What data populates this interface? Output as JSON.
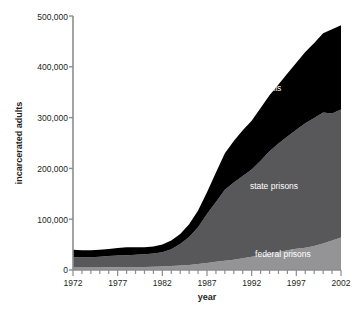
{
  "chart_data": {
    "type": "area",
    "stacked": true,
    "title": "",
    "xlabel": "year",
    "ylabel": "incarcerated adults",
    "xlim": [
      1972,
      2002
    ],
    "ylim": [
      0,
      500000
    ],
    "grid": false,
    "legend_position": "inline-labels",
    "x_ticks": [
      "1972",
      "1977",
      "1982",
      "1987",
      "1992",
      "1997",
      "2002"
    ],
    "x_tick_values": [
      1972,
      1977,
      1982,
      1987,
      1992,
      1997,
      2002
    ],
    "x_minor_tick_step": 1,
    "y_ticks": [
      "0",
      "100,000",
      "200,000",
      "300,000",
      "400,000",
      "500,000"
    ],
    "y_tick_values": [
      0,
      100000,
      200000,
      300000,
      400000,
      500000
    ],
    "x": [
      1972,
      1973,
      1974,
      1975,
      1976,
      1977,
      1978,
      1979,
      1980,
      1981,
      1982,
      1983,
      1984,
      1985,
      1986,
      1987,
      1988,
      1989,
      1990,
      1991,
      1992,
      1993,
      1994,
      1995,
      1996,
      1997,
      1998,
      1999,
      2000,
      2001,
      2002
    ],
    "series": [
      {
        "name": "federal prisons",
        "color": "#949496",
        "label_color": "#ffffff",
        "values": [
          5000,
          5000,
          5000,
          5000,
          5500,
          5500,
          6000,
          6000,
          6000,
          6500,
          7000,
          8000,
          9000,
          10000,
          12000,
          14000,
          16000,
          18000,
          20000,
          23000,
          26000,
          29000,
          32000,
          35000,
          39000,
          42000,
          44000,
          47000,
          52000,
          58000,
          64000
        ]
      },
      {
        "name": "state prisons",
        "color": "#58585a",
        "label_color": "#ffffff",
        "values": [
          20000,
          20000,
          20000,
          21000,
          22000,
          23000,
          23000,
          24000,
          25000,
          26000,
          28000,
          33000,
          42000,
          55000,
          72000,
          96000,
          118000,
          140000,
          152000,
          162000,
          172000,
          186000,
          202000,
          214000,
          224000,
          234000,
          245000,
          252000,
          258000,
          250000,
          252000
        ]
      },
      {
        "name": "jails",
        "color": "#000000",
        "label_color": "#ffffff",
        "values": [
          15000,
          14000,
          14000,
          14000,
          14000,
          15000,
          16000,
          15000,
          14000,
          14000,
          15000,
          17000,
          20000,
          25000,
          33000,
          43000,
          58000,
          72000,
          82000,
          90000,
          96000,
          104000,
          110000,
          116000,
          124000,
          132000,
          140000,
          148000,
          156000,
          166000,
          166000
        ]
      }
    ],
    "totals_note": "stacked totals rise from ~40,000 in 1972 to ~482,000 in 2002",
    "annotations": [
      {
        "text": "jails",
        "x": 1994.5,
        "y": 352000
      },
      {
        "text": "state prisons",
        "x": 1994.5,
        "y": 160000
      },
      {
        "text": "federal prisons",
        "x": 1995.5,
        "y": 26000
      }
    ]
  }
}
